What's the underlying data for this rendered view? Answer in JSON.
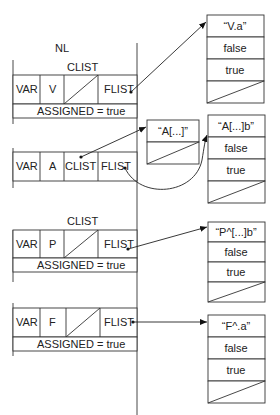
{
  "diagram": {
    "title": "NL",
    "left_table": {
      "blocks": [
        {
          "header": "CLIST",
          "cells": [
            "VAR",
            "V",
            "",
            "FLIST"
          ],
          "clist_null": true,
          "assigned": "ASSIGNED = true"
        },
        {
          "header": "",
          "cells": [
            "VAR",
            "A",
            "CLIST",
            "FLIST"
          ],
          "clist_null": false,
          "assigned": ""
        },
        {
          "header": "CLIST",
          "cells": [
            "VAR",
            "P",
            "",
            "FLIST"
          ],
          "clist_null": true,
          "assigned": "ASSIGNED = true"
        },
        {
          "header": "",
          "cells": [
            "VAR",
            "F",
            "",
            "FLIST"
          ],
          "clist_null": true,
          "assigned": "ASSIGNED = true"
        }
      ]
    },
    "clist_box": {
      "label": "“A[...]”"
    },
    "flist_boxes": [
      {
        "name": "“V.a”",
        "row2": "false",
        "row3": "true"
      },
      {
        "name": "“A[...]b”",
        "row2": "false",
        "row3": "true"
      },
      {
        "name": "“P^[...]b”",
        "row2": "false",
        "row3": "true"
      },
      {
        "name": "“F^.a”",
        "row2": "false",
        "row3": "true"
      }
    ]
  }
}
